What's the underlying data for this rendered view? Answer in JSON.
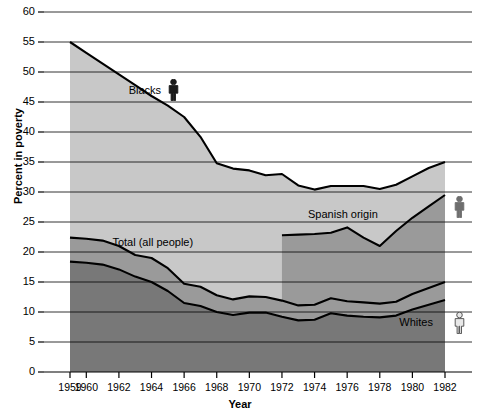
{
  "chart_data": {
    "type": "area",
    "title": "",
    "xlabel": "Year",
    "ylabel": "Percent in poverty",
    "xlim": [
      1959,
      1982
    ],
    "ylim": [
      0,
      60
    ],
    "ytick_values": [
      0,
      5,
      10,
      15,
      20,
      25,
      30,
      35,
      40,
      45,
      50,
      55,
      60
    ],
    "xtick_values": [
      1959,
      1960,
      1962,
      1964,
      1966,
      1968,
      1970,
      1972,
      1974,
      1976,
      1978,
      1980,
      1982
    ],
    "grid": true,
    "legend_position": "inline-annotations",
    "series": [
      {
        "name": "Blacks",
        "icon": "person-icon-dark",
        "color": "#c8c8c8",
        "label_x": 1962.6,
        "label_y": 47.5,
        "x": [
          1959,
          1960,
          1961,
          1962,
          1963,
          1964,
          1965,
          1966,
          1967,
          1968,
          1969,
          1970,
          1971,
          1972,
          1973,
          1974,
          1975,
          1976,
          1977,
          1978,
          1979,
          1980,
          1981,
          1982
        ],
        "values": [
          55.0,
          53.2,
          51.4,
          49.6,
          47.8,
          46.0,
          44.4,
          42.5,
          39.2,
          34.8,
          33.9,
          33.6,
          32.8,
          33.0,
          31.1,
          30.4,
          31.0,
          31.0,
          31.0,
          30.5,
          31.2,
          32.6,
          34.0,
          35.0
        ]
      },
      {
        "name": "Spanish origin",
        "icon": "person-icon-medium",
        "color": "#9a9a9a",
        "label_x": 1973.6,
        "label_y": 26.0,
        "x": [
          1972,
          1973,
          1974,
          1975,
          1976,
          1977,
          1978,
          1979,
          1980,
          1981,
          1982
        ],
        "values": [
          22.8,
          22.9,
          23.0,
          23.2,
          24.1,
          22.4,
          21.0,
          23.5,
          25.7,
          27.6,
          29.5
        ]
      },
      {
        "name": "Total (all people)",
        "icon": "",
        "color": "#9a9a9a",
        "label_x": 1961.6,
        "label_y": 21.3,
        "x": [
          1959,
          1960,
          1961,
          1962,
          1963,
          1964,
          1965,
          1966,
          1967,
          1968,
          1969,
          1970,
          1971,
          1972,
          1973,
          1974,
          1975,
          1976,
          1977,
          1978,
          1979,
          1980,
          1981,
          1982
        ],
        "values": [
          22.4,
          22.2,
          21.9,
          21.0,
          19.5,
          19.0,
          17.3,
          14.7,
          14.2,
          12.8,
          12.1,
          12.6,
          12.5,
          11.9,
          11.1,
          11.2,
          12.3,
          11.8,
          11.6,
          11.4,
          11.7,
          13.0,
          14.0,
          15.0
        ]
      },
      {
        "name": "Whites",
        "icon": "person-icon-light",
        "color": "#787878",
        "label_x": 1979.2,
        "label_y": 8.0,
        "x": [
          1959,
          1960,
          1961,
          1962,
          1963,
          1964,
          1965,
          1966,
          1967,
          1968,
          1969,
          1970,
          1971,
          1972,
          1973,
          1974,
          1975,
          1976,
          1977,
          1978,
          1979,
          1980,
          1981,
          1982
        ],
        "values": [
          18.4,
          18.2,
          17.9,
          17.1,
          15.9,
          15.0,
          13.5,
          11.5,
          11.0,
          10.0,
          9.5,
          9.9,
          9.9,
          9.2,
          8.6,
          8.7,
          9.8,
          9.4,
          9.2,
          9.1,
          9.4,
          10.4,
          11.2,
          12.0
        ]
      }
    ]
  },
  "colors": {
    "band_blacks": "#c8c8c8",
    "band_spanish": "#9a9a9a",
    "band_total": "#9a9a9a",
    "band_whites": "#787878",
    "line": "#000000",
    "grid": "#000000",
    "axis": "#000000",
    "icon_dark": "#1a1a1a",
    "icon_medium": "#6e6e6e",
    "icon_light": "#e8e8e8"
  }
}
